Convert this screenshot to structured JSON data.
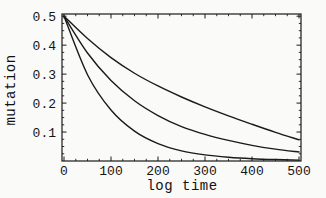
{
  "figure": {
    "background_color": "#fafaf8",
    "line_color": "#1a1a1a",
    "text_color": "#111111"
  },
  "chart_data": {
    "type": "line",
    "title": "",
    "xlabel": "log time",
    "ylabel": "mutation",
    "xlim": [
      0,
      500
    ],
    "ylim": [
      0,
      0.5
    ],
    "grid": false,
    "legend": "none",
    "frame_box": true,
    "x_ticks": {
      "values": [
        0,
        100,
        200,
        300,
        400,
        500
      ],
      "labels": [
        "0",
        "100",
        "200",
        "300",
        "400",
        "500"
      ],
      "minor_step": 25
    },
    "y_ticks": {
      "values": [
        0.1,
        0.2,
        0.3,
        0.4,
        0.5
      ],
      "labels": [
        "0.1",
        "0.2",
        "0.3",
        "0.4",
        "0.5"
      ],
      "minor_step": 0.025
    },
    "x": [
      0,
      50,
      100,
      150,
      200,
      250,
      300,
      350,
      400,
      450,
      500
    ],
    "series": [
      {
        "name": "curve-top-slow-decay",
        "values": [
          0.5,
          0.423,
          0.357,
          0.303,
          0.259,
          0.221,
          0.187,
          0.156,
          0.127,
          0.099,
          0.073
        ]
      },
      {
        "name": "curve-middle-medium-decay",
        "values": [
          0.5,
          0.373,
          0.278,
          0.208,
          0.157,
          0.119,
          0.092,
          0.071,
          0.054,
          0.041,
          0.031
        ]
      },
      {
        "name": "curve-bottom-fast-decay",
        "values": [
          0.5,
          0.298,
          0.176,
          0.103,
          0.06,
          0.035,
          0.021,
          0.013,
          0.008,
          0.005,
          0.003
        ]
      }
    ]
  }
}
